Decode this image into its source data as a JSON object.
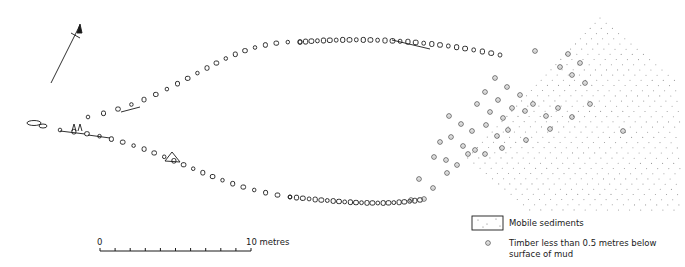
{
  "figure": {
    "type": "archaeological site plan"
  },
  "north_arrow": {
    "icon": "north-arrow-icon",
    "x1": 51,
    "y1": 83,
    "x2": 80,
    "y2": 25
  },
  "scale_bar": {
    "start_label": "0",
    "end_label": "10 metres",
    "x_start": 100,
    "x_end": 251,
    "y": 251,
    "divisions": 10
  },
  "legend": {
    "items": [
      {
        "symbol": "stippled-box-icon",
        "label": "Mobile sediments"
      },
      {
        "symbol": "timber-circle-icon",
        "label_line1": "Timber less than 0.5 metres below",
        "label_line2": "surface of mud"
      }
    ]
  },
  "colors": {
    "ink": "#1a1a1a",
    "grid_dot": "#9a9a9a",
    "timber_circle": "#555555",
    "background": "#ffffff"
  },
  "timbers_below_mud": [
    [
      535,
      51
    ],
    [
      568,
      54
    ],
    [
      580,
      63
    ],
    [
      560,
      67
    ],
    [
      572,
      75
    ],
    [
      585,
      83
    ],
    [
      495,
      78
    ],
    [
      507,
      87
    ],
    [
      520,
      95
    ],
    [
      485,
      92
    ],
    [
      498,
      100
    ],
    [
      512,
      108
    ],
    [
      533,
      104
    ],
    [
      477,
      104
    ],
    [
      490,
      112
    ],
    [
      503,
      118
    ],
    [
      525,
      111
    ],
    [
      546,
      116
    ],
    [
      558,
      108
    ],
    [
      572,
      117
    ],
    [
      590,
      104
    ],
    [
      623,
      131
    ],
    [
      449,
      116
    ],
    [
      461,
      124
    ],
    [
      472,
      131
    ],
    [
      486,
      125
    ],
    [
      497,
      136
    ],
    [
      508,
      130
    ],
    [
      550,
      129
    ],
    [
      526,
      140
    ],
    [
      451,
      137
    ],
    [
      463,
      146
    ],
    [
      475,
      150
    ],
    [
      485,
      154
    ],
    [
      440,
      142
    ],
    [
      434,
      157
    ],
    [
      446,
      160
    ],
    [
      457,
      165
    ],
    [
      468,
      154
    ],
    [
      502,
      148
    ],
    [
      419,
      179
    ],
    [
      433,
      188
    ],
    [
      424,
      199
    ],
    [
      447,
      173
    ],
    [
      411,
      200
    ]
  ]
}
